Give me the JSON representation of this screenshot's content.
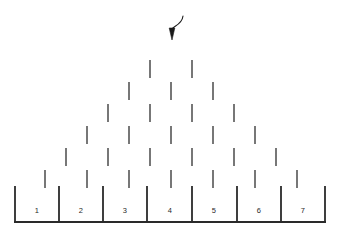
{
  "figure": {
    "kind": "galton-board-diagram",
    "title": "",
    "background_color": "#ffffff",
    "ink_color": "#2a2a2a",
    "width": 342,
    "height": 240
  },
  "entry_arrow": {
    "name": "entry-arrow",
    "description": "curved arrow pointing down into the top of the peg array",
    "tip_x": 172,
    "tip_y": 40,
    "tail_x": 183,
    "tail_y": 16,
    "color": "#1a1a1a"
  },
  "pegs": {
    "row_count": 6,
    "tick_height": 18,
    "color": "#555555",
    "rows": [
      {
        "index": 1,
        "count": 2,
        "y": 60,
        "xs": [
          150,
          192
        ]
      },
      {
        "index": 2,
        "count": 3,
        "y": 82,
        "xs": [
          129,
          171,
          213
        ]
      },
      {
        "index": 3,
        "count": 4,
        "y": 104,
        "xs": [
          108,
          150,
          192,
          234
        ]
      },
      {
        "index": 4,
        "count": 5,
        "y": 126,
        "xs": [
          87,
          129,
          171,
          213,
          255
        ]
      },
      {
        "index": 5,
        "count": 6,
        "y": 148,
        "xs": [
          66,
          108,
          150,
          192,
          234,
          276
        ]
      },
      {
        "index": 6,
        "count": 7,
        "y": 170,
        "xs": [
          45,
          87,
          129,
          171,
          213,
          255,
          297
        ]
      }
    ]
  },
  "bins": {
    "count": 7,
    "left_x": 15,
    "right_x": 325,
    "top_y": 186,
    "floor_y": 222,
    "wall_color": "#2a2a2a",
    "label_y": 210,
    "items": [
      {
        "label": "1",
        "center_x": 37,
        "left_x": 15,
        "right_x": 59
      },
      {
        "label": "2",
        "center_x": 81,
        "left_x": 59,
        "right_x": 103
      },
      {
        "label": "3",
        "center_x": 125,
        "left_x": 103,
        "right_x": 147
      },
      {
        "label": "4",
        "center_x": 170,
        "left_x": 147,
        "right_x": 192
      },
      {
        "label": "5",
        "center_x": 214,
        "left_x": 192,
        "right_x": 237
      },
      {
        "label": "6",
        "center_x": 259,
        "left_x": 237,
        "right_x": 281
      },
      {
        "label": "7",
        "center_x": 303,
        "left_x": 281,
        "right_x": 325
      }
    ]
  },
  "chart_data": {
    "type": "diagram",
    "title": "",
    "xlabel": "",
    "ylabel": "",
    "categories": [
      "1",
      "2",
      "3",
      "4",
      "5",
      "6",
      "7"
    ],
    "values": [
      0,
      0,
      0,
      0,
      0,
      0,
      0
    ],
    "annotations": [
      "entry arrow at top center"
    ]
  }
}
